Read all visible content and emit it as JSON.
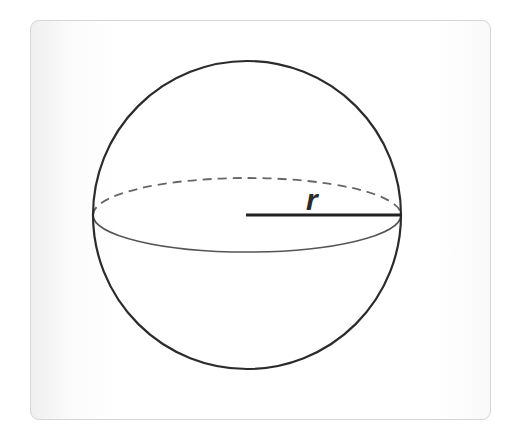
{
  "diagram": {
    "shape": "sphere",
    "label": "r",
    "label_meaning": "radius",
    "colors": {
      "outline": "#2b2b2b",
      "equator_front": "#555555",
      "equator_back_dashed": "#666666",
      "radius_line": "#222222",
      "card_border": "#d6d6d6",
      "background": "#ffffff"
    },
    "geometry": {
      "center": [
        247,
        215
      ],
      "radius_px": 154,
      "equator_ry_px": 37
    }
  }
}
